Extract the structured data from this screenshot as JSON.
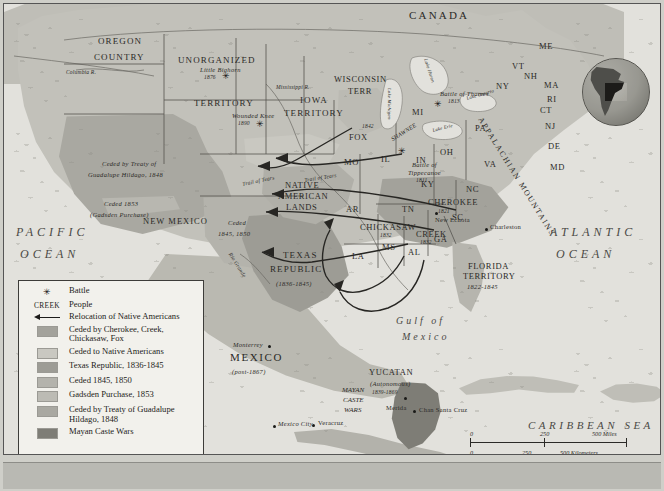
{
  "map": {
    "title": "Native American Relocation and Territorial Cessions, 1820s-1860s",
    "countries": [
      {
        "name": "CANADA",
        "x": 405,
        "y": 8
      },
      {
        "name": "MEXICO",
        "x": 226,
        "y": 355
      },
      {
        "name": "(post-1867)",
        "x": 228,
        "y": 369
      }
    ],
    "oceans": [
      {
        "name": "PACIFIC",
        "x": 12,
        "y": 228
      },
      {
        "name": "OCEAN",
        "x": 16,
        "y": 250
      },
      {
        "name": "ATLANTIC",
        "x": 546,
        "y": 228
      },
      {
        "name": "OCEAN",
        "x": 552,
        "y": 250
      },
      {
        "name": "CARIBBEAN SEA",
        "x": 524,
        "y": 422
      },
      {
        "name": "Gulf of",
        "x": 392,
        "y": 318
      },
      {
        "name": "Mexico",
        "x": 398,
        "y": 334
      }
    ],
    "territories": [
      {
        "name": "OREGON",
        "x": 94,
        "y": 38
      },
      {
        "name": "COUNTRY",
        "x": 92,
        "y": 54
      },
      {
        "name": "UNORGANIZED",
        "x": 177,
        "y": 57
      },
      {
        "name": "TERRITORY",
        "x": 190,
        "y": 100
      },
      {
        "name": "IOWA",
        "x": 296,
        "y": 97
      },
      {
        "name": "TERRITORY",
        "x": 282,
        "y": 110
      },
      {
        "name": "WISCONSIN",
        "x": 330,
        "y": 76
      },
      {
        "name": "TERR",
        "x": 344,
        "y": 88
      },
      {
        "name": "NATIVE",
        "x": 281,
        "y": 181
      },
      {
        "name": "AMERICAN",
        "x": 274,
        "y": 192
      },
      {
        "name": "LANDS",
        "x": 282,
        "y": 203
      },
      {
        "name": "TEXAS",
        "x": 279,
        "y": 251
      },
      {
        "name": "REPUBLIC",
        "x": 268,
        "y": 265
      },
      {
        "name": "(1836-1845)",
        "x": 272,
        "y": 279
      },
      {
        "name": "NEW MEXICO",
        "x": 139,
        "y": 216
      },
      {
        "name": "FLORIDA",
        "x": 464,
        "y": 262
      },
      {
        "name": "TERRITORY",
        "x": 459,
        "y": 272
      },
      {
        "name": "1822-1845",
        "x": 463,
        "y": 282
      },
      {
        "name": "YUCATAN",
        "x": 367,
        "y": 368
      },
      {
        "name": "(Autonomous)",
        "x": 366,
        "y": 379
      },
      {
        "name": "1839-1869",
        "x": 368,
        "y": 388
      },
      {
        "name": "MAYAN",
        "x": 340,
        "y": 387
      },
      {
        "name": "CASTE",
        "x": 341,
        "y": 397
      },
      {
        "name": "WARS",
        "x": 342,
        "y": 407
      }
    ],
    "cession_labels": [
      {
        "name": "Ceded by Treaty of",
        "x": 98,
        "y": 160
      },
      {
        "name": "Guadalupe Hildago, 1848",
        "x": 86,
        "y": 171
      },
      {
        "name": "Ceded 1853",
        "x": 100,
        "y": 200
      },
      {
        "name": "(Gadsden Purchase)",
        "x": 88,
        "y": 210
      },
      {
        "name": "Ceded",
        "x": 224,
        "y": 219
      },
      {
        "name": "1845, 1850",
        "x": 216,
        "y": 230
      }
    ],
    "states": [
      {
        "abbr": "ME",
        "x": 535,
        "y": 42
      },
      {
        "abbr": "VT",
        "x": 508,
        "y": 62
      },
      {
        "abbr": "NH",
        "x": 520,
        "y": 72
      },
      {
        "abbr": "MA",
        "x": 540,
        "y": 81
      },
      {
        "abbr": "RI",
        "x": 543,
        "y": 95
      },
      {
        "abbr": "CT",
        "x": 536,
        "y": 106
      },
      {
        "abbr": "NY",
        "x": 492,
        "y": 82
      },
      {
        "abbr": "NJ",
        "x": 541,
        "y": 122
      },
      {
        "abbr": "DE",
        "x": 544,
        "y": 142
      },
      {
        "abbr": "MD",
        "x": 546,
        "y": 163
      },
      {
        "abbr": "PA",
        "x": 471,
        "y": 124
      },
      {
        "abbr": "VA",
        "x": 480,
        "y": 160
      },
      {
        "abbr": "NC",
        "x": 462,
        "y": 185
      },
      {
        "abbr": "SC",
        "x": 448,
        "y": 213
      },
      {
        "abbr": "GA",
        "x": 430,
        "y": 235
      },
      {
        "abbr": "MI",
        "x": 408,
        "y": 108
      },
      {
        "abbr": "OH",
        "x": 436,
        "y": 148
      },
      {
        "abbr": "IN",
        "x": 412,
        "y": 156
      },
      {
        "abbr": "IL",
        "x": 377,
        "y": 155
      },
      {
        "abbr": "KY",
        "x": 417,
        "y": 180
      },
      {
        "abbr": "TN",
        "x": 398,
        "y": 205
      },
      {
        "abbr": "MO",
        "x": 340,
        "y": 158
      },
      {
        "abbr": "AR",
        "x": 342,
        "y": 205
      },
      {
        "abbr": "LA",
        "x": 348,
        "y": 252
      },
      {
        "abbr": "MS",
        "x": 378,
        "y": 243
      },
      {
        "abbr": "AL",
        "x": 404,
        "y": 248
      },
      {
        "abbr": "FOX",
        "x": 348,
        "y": 133
      },
      {
        "abbr": "IA",
        "x": 312,
        "y": 120
      }
    ],
    "peoples": [
      {
        "name": "CHEROKEE",
        "year": "1821",
        "x": 428,
        "y": 198
      },
      {
        "name": "CHICKASAW",
        "year": "1832",
        "x": 359,
        "y": 223
      },
      {
        "name": "CREEK",
        "year": "1832",
        "x": 414,
        "y": 230
      },
      {
        "name": "FOX",
        "year": "1842",
        "x": 352,
        "y": 126
      }
    ],
    "battles": [
      {
        "name": "Little Bighorn",
        "year": "1876",
        "x": 200,
        "y": 68
      },
      {
        "name": "Wounded Knee",
        "year": "1890",
        "x": 232,
        "y": 113
      },
      {
        "name": "Battle of Thames",
        "year": "1813",
        "x": 438,
        "y": 90
      },
      {
        "name": "Battle of",
        "year": "1811",
        "x": 412,
        "y": 160,
        "name2": "Tippecanoe"
      }
    ],
    "cities": [
      {
        "name": "Charleston",
        "x": 485,
        "y": 226
      },
      {
        "name": "New Echota",
        "x": 434,
        "y": 216
      },
      {
        "name": "Monterrey",
        "x": 238,
        "y": 343
      },
      {
        "name": "Mexico City",
        "x": 280,
        "y": 422
      },
      {
        "name": "Veracruz",
        "x": 308,
        "y": 417
      },
      {
        "name": "Merida",
        "x": 392,
        "y": 407
      },
      {
        "name": "Chan Santa Cruz",
        "x": 413,
        "y": 406
      }
    ],
    "features": [
      {
        "name": "Columbia R.",
        "x": 72,
        "y": 70
      },
      {
        "name": "Mississippi R.",
        "x": 283,
        "y": 84
      },
      {
        "name": "Rio Grande",
        "x": 228,
        "y": 255
      },
      {
        "name": "Trail of Tears",
        "x": 319,
        "y": 180
      },
      {
        "name": "Trail of Tears",
        "x": 258,
        "y": 178
      },
      {
        "name": "Lake Michigan",
        "x": 391,
        "y": 99
      },
      {
        "name": "Lake Huron",
        "x": 428,
        "y": 62
      },
      {
        "name": "Lake Erie",
        "x": 437,
        "y": 128
      },
      {
        "name": "Lake Ontario",
        "x": 470,
        "y": 97
      },
      {
        "name": "APPALACHIAN MOUNTAINS",
        "x": 479,
        "y": 118
      },
      {
        "name": "SHAWNEE",
        "x": 394,
        "y": 137
      }
    ],
    "scale": {
      "miles": [
        "0",
        "250",
        "500 Miles"
      ],
      "kilometers": [
        "0",
        "250",
        "500 Kilometers"
      ]
    }
  },
  "legend": {
    "rows": [
      {
        "key": "star",
        "label": "Battle"
      },
      {
        "key": "creek",
        "keytext": "CREEK",
        "label": "People"
      },
      {
        "key": "arrow",
        "label": "Relocation of Native Americans"
      },
      {
        "key": "swatch",
        "color": "#a3a29b",
        "label": "Ceded by Cherokee, Creek, Chickasaw, Fox"
      },
      {
        "key": "swatch",
        "color": "#c9c8c1",
        "label": "Ceded to Native Americans"
      },
      {
        "key": "swatch",
        "color": "#9d9c95",
        "label": "Texas Republic, 1836-1845"
      },
      {
        "key": "swatch",
        "color": "#b4b3ac",
        "label": "Ceded 1845, 1850"
      },
      {
        "key": "swatch",
        "color": "#bcbbb4",
        "label": "Gadsden Purchase, 1853"
      },
      {
        "key": "swatch",
        "color": "#a9a8a1",
        "label": "Ceded by Treaty of Guadalupe Hildago, 1848"
      },
      {
        "key": "swatch",
        "color": "#7e7d76",
        "label": "Mayan Caste Wars"
      }
    ]
  }
}
